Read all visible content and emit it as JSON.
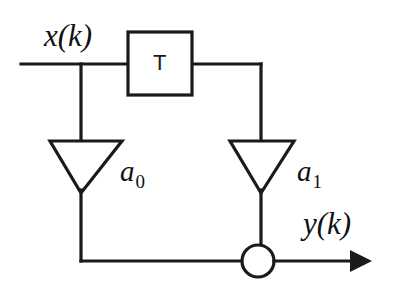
{
  "figure": {
    "kind": "signal-flow-block-diagram",
    "background_color": "#ffffff",
    "line_color": "#1a1a1a"
  },
  "labels": {
    "input_signal": "x(k)",
    "output_signal": "y(k)",
    "delay_block": "T",
    "gain_top": "a",
    "gain_top_sub": "0",
    "gain_bottom": "a",
    "gain_bottom_sub": "1"
  },
  "blocks": {
    "delay": {
      "name": "unit-delay-block",
      "label": "T",
      "x": 128,
      "y": 32,
      "width": 64,
      "height": 63
    },
    "amplifier_a0": {
      "name": "amplifier-a0",
      "label": "a0",
      "apex_x": 81,
      "apex_y": 192,
      "top_y": 141,
      "left_x": 50,
      "right_x": 122
    },
    "amplifier_a1": {
      "name": "amplifier-a1",
      "label": "a1",
      "apex_x": 261,
      "apex_y": 192,
      "top_y": 141,
      "left_x": 230,
      "right_x": 294
    },
    "summing_junction": {
      "name": "summing-junction",
      "center_x": 258,
      "center_y": 261,
      "radius": 16
    }
  },
  "wires": {
    "input_line": {
      "x1": 21,
      "y1": 64,
      "x2": 128,
      "y2": 64
    },
    "input_tap_down": {
      "x1": 81,
      "y1": 64,
      "x2": 81,
      "y2": 141
    },
    "delay_output": {
      "x1": 192,
      "y1": 64,
      "x2": 261,
      "y2": 64
    },
    "delay_drop": {
      "x1": 261,
      "y1": 64,
      "x2": 261,
      "y2": 141
    },
    "a0_to_bottom": {
      "x1": 81,
      "y1": 192,
      "x2": 81,
      "y2": 261
    },
    "bottom_feedback": {
      "x1": 81,
      "y1": 261,
      "x2": 242,
      "y2": 261
    },
    "a1_to_sum": {
      "x1": 261,
      "y1": 192,
      "x2": 261,
      "y2": 245
    },
    "output_line": {
      "x1": 274,
      "y1": 261,
      "x2": 352,
      "y2": 261
    },
    "output_arrow_tip_x": 370
  }
}
